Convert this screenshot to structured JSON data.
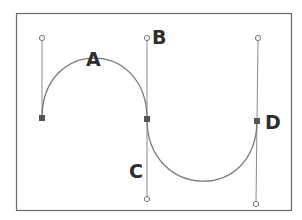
{
  "diagram": {
    "type": "bezier-path-illustration",
    "colors": {
      "background": "#ffffff",
      "frame": "#6a6a6a",
      "curve": "#7a7a7a",
      "handle_line": "#8a8a8a",
      "anchor_fill": "#555555",
      "label": "#2e2e2e"
    },
    "labels": {
      "a": "A",
      "b": "B",
      "c": "C",
      "d": "D"
    },
    "anchors": [
      {
        "id": "left-anchor",
        "x": 42,
        "y": 118
      },
      {
        "id": "middle-anchor",
        "x": 147,
        "y": 119
      },
      {
        "id": "right-anchor",
        "x": 257,
        "y": 121
      }
    ],
    "handles": [
      {
        "id": "left-handle-top",
        "x": 42,
        "y": 38
      },
      {
        "id": "middle-handle-top",
        "x": 147,
        "y": 38
      },
      {
        "id": "middle-handle-bottom",
        "x": 147,
        "y": 199
      },
      {
        "id": "right-handle-top",
        "x": 258,
        "y": 38
      },
      {
        "id": "right-handle-bottom",
        "x": 256,
        "y": 204
      }
    ]
  }
}
